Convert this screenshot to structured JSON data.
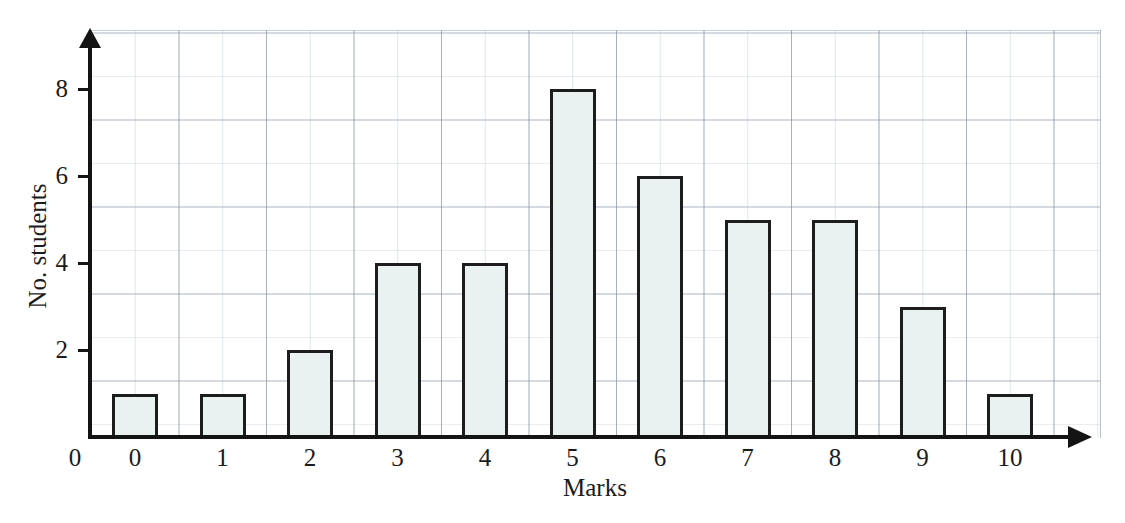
{
  "chart_data": {
    "type": "bar",
    "title": "",
    "xlabel": "Marks",
    "ylabel": "No. students",
    "categories": [
      "0",
      "1",
      "2",
      "3",
      "4",
      "5",
      "6",
      "7",
      "8",
      "9",
      "10"
    ],
    "values": [
      1,
      1,
      2,
      4,
      4,
      8,
      6,
      5,
      5,
      3,
      1
    ],
    "series": [
      {
        "name": "No. students",
        "values": [
          1,
          1,
          2,
          4,
          4,
          8,
          6,
          5,
          5,
          3,
          1
        ]
      }
    ],
    "xlim": [
      0,
      11
    ],
    "ylim": [
      0,
      9
    ],
    "y_ticks": [
      2,
      4,
      6,
      8
    ],
    "y_tick_labels": [
      "2",
      "4",
      "6",
      "8"
    ],
    "x_tick_labels": [
      "0",
      "1",
      "2",
      "3",
      "4",
      "5",
      "6",
      "7",
      "8",
      "9",
      "10"
    ],
    "origin_label": "0",
    "grid": true,
    "legend": "none",
    "bar_fill_color": "#e9f1f1",
    "bar_edge_color": "#1d1d1d",
    "grid_color": "#8fa6b8",
    "axis_color": "#141414"
  }
}
